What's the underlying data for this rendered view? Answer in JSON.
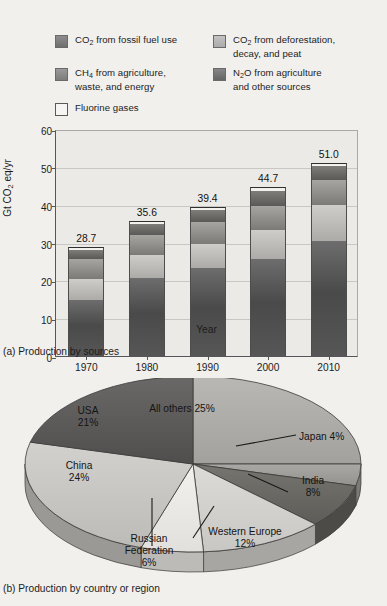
{
  "legend": {
    "items": [
      {
        "id": "fossil",
        "swatch": "fossil-co2-swatch",
        "label_html": "CO<sub>2</sub> from fossil fuel use",
        "color": "#5c5c5c"
      },
      {
        "id": "deforestation",
        "swatch": "deforestation-co2-swatch",
        "label_html": "CO<sub>2</sub> from deforestation, decay, and peat",
        "color": "#b8b6b2"
      },
      {
        "id": "ch4",
        "swatch": "ch4-swatch",
        "label_html": "CH<sub>4</sub> from agriculture, waste, and energy",
        "color": "#8b8a87"
      },
      {
        "id": "n2o",
        "swatch": "n2o-swatch",
        "label_html": "N<sub>2</sub>O from agriculture and other sources",
        "color": "#6c6b68"
      },
      {
        "id": "fluorine",
        "swatch": "fluorine-swatch",
        "label_html": "Fluorine gases",
        "color": "#f4f3f0"
      }
    ]
  },
  "panel_a": {
    "caption": "(a) Production by sources",
    "xlabel": "Year"
  },
  "panel_b": {
    "caption": "(b) Production by country or region"
  },
  "chart_data": [
    {
      "type": "bar",
      "subtype": "stacked-bar",
      "title": "(a) Production by sources",
      "xlabel": "Year",
      "ylabel": "Gt CO2 eq/yr",
      "ylabel_html": "Gt CO<sub>2</sub> eq/yr",
      "ylim": [
        0,
        60
      ],
      "yticks": [
        0,
        10,
        20,
        30,
        40,
        50,
        60
      ],
      "grid": true,
      "legend_position": "above-plot",
      "categories": [
        "1970",
        "1980",
        "1990",
        "2000",
        "2010"
      ],
      "totals": [
        28.7,
        35.6,
        39.4,
        44.7,
        51.0
      ],
      "total_labels": [
        "28.7",
        "35.6",
        "39.4",
        "44.7",
        "51.0"
      ],
      "series": [
        {
          "name": "CO2 from fossil fuel use",
          "key": "fossil",
          "color": "#545454",
          "values": [
            14.9,
            20.5,
            23.2,
            25.7,
            30.4
          ]
        },
        {
          "name": "CO2 from deforestation, decay, and peat",
          "key": "defor",
          "color": "#bcbab6",
          "values": [
            5.5,
            6.1,
            6.4,
            7.5,
            9.6
          ]
        },
        {
          "name": "CH4 from agriculture, waste, and energy",
          "key": "ch4",
          "color": "#90908c",
          "values": [
            5.2,
            5.4,
            5.7,
            6.5,
            6.6
          ]
        },
        {
          "name": "N2O from agriculture and other sources",
          "key": "n2o",
          "color": "#6a6967",
          "values": [
            2.3,
            2.8,
            3.2,
            4.0,
            3.5
          ]
        },
        {
          "name": "Fluorine gases",
          "key": "fluor",
          "color": "#f2f1ee",
          "values": [
            0.8,
            0.8,
            0.9,
            1.0,
            0.9
          ]
        }
      ]
    },
    {
      "type": "pie",
      "subtype": "pie-3d",
      "title": "(b) Production by country or region",
      "unit": "%",
      "labels": [
        "All others",
        "Japan",
        "India",
        "Western Europe",
        "Russian Federation",
        "China",
        "USA"
      ],
      "values": [
        25,
        4,
        8,
        12,
        6,
        24,
        21
      ],
      "value_labels": [
        "All others 25%",
        "Japan 4%",
        "India\n8%",
        "Western Europe\n12%",
        "Russian\nFederation\n6%",
        "China\n24%",
        "USA\n21%"
      ],
      "colors": [
        "#b0aeaa",
        "#9f9d99",
        "#6d6c69",
        "#d6d4d0",
        "#ecebe7",
        "#cbc9c5",
        "#5e5d5b"
      ],
      "leader_lines": [
        "Japan",
        "India",
        "Western Europe",
        "Russian Federation"
      ]
    }
  ],
  "pie_labels": {
    "all_others": "All others 25%",
    "japan": "Japan 4%",
    "india_name": "India",
    "india_pct": "8%",
    "western_europe_name": "Western Europe",
    "western_europe_pct": "12%",
    "russia_line1": "Russian",
    "russia_line2": "Federation",
    "russia_pct": "6%",
    "china_name": "China",
    "china_pct": "24%",
    "usa_name": "USA",
    "usa_pct": "21%"
  }
}
